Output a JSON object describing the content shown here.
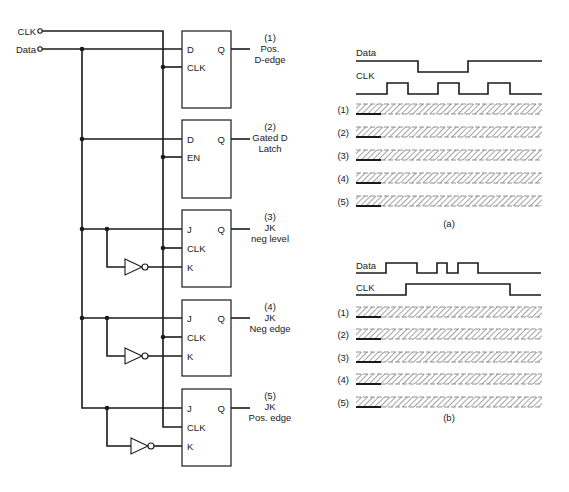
{
  "inputs": [
    {
      "label": "CLK",
      "y": 31
    },
    {
      "label": "Data",
      "y": 49
    }
  ],
  "colors": {
    "ink": "#1a1a1a",
    "hatch": "#555555",
    "background": "#ffffff"
  },
  "flipflops": [
    {
      "id": 1,
      "type": "D",
      "top": 31,
      "bottom": 108,
      "pins": [
        "D",
        "CLK"
      ],
      "pin_y": [
        49,
        67
      ],
      "q_label": "Q",
      "out_y": 49,
      "caption": [
        "(1)",
        "Pos.",
        "D-edge"
      ]
    },
    {
      "id": 2,
      "type": "D-latch",
      "top": 120,
      "bottom": 198,
      "pins": [
        "D",
        "EN"
      ],
      "pin_y": [
        139,
        157
      ],
      "q_label": "Q",
      "out_y": 139,
      "caption": [
        "(2)",
        "Gated D",
        "Latch"
      ]
    },
    {
      "id": 3,
      "type": "JK",
      "top": 210,
      "bottom": 287,
      "pins": [
        "J",
        "CLK",
        "K"
      ],
      "pin_y": [
        229,
        248,
        267
      ],
      "q_label": "Q",
      "out_y": 229,
      "caption": [
        "(3)",
        "JK",
        "neg level"
      ],
      "inverter_x": 125
    },
    {
      "id": 4,
      "type": "JK",
      "top": 300,
      "bottom": 376,
      "pins": [
        "J",
        "CLK",
        "K"
      ],
      "pin_y": [
        318,
        337,
        356
      ],
      "q_label": "Q",
      "out_y": 318,
      "caption": [
        "(4)",
        "JK",
        "Neg edge"
      ],
      "inverter_x": 125
    },
    {
      "id": 5,
      "type": "JK",
      "top": 389,
      "bottom": 466,
      "pins": [
        "J",
        "CLK",
        "K"
      ],
      "pin_y": [
        408,
        427,
        446
      ],
      "q_label": "Q",
      "out_y": 408,
      "caption": [
        "(5)",
        "JK",
        "Pos. edge"
      ],
      "inverter_x": 131
    }
  ],
  "timing": [
    {
      "id": "a",
      "caption": "(a)",
      "caption_y": 227,
      "signals": [
        {
          "label": "Data",
          "label_y": 56,
          "high_y": 61,
          "low_y": 72,
          "points": [
            [
              356,
              "H"
            ],
            [
              418,
              "H"
            ],
            [
              418,
              "L"
            ],
            [
              468,
              "L"
            ],
            [
              468,
              "H"
            ],
            [
              542,
              "H"
            ]
          ]
        },
        {
          "label": "CLK",
          "label_y": 79,
          "high_y": 83,
          "low_y": 94,
          "points": [
            [
              356,
              "L"
            ],
            [
              387,
              "L"
            ],
            [
              387,
              "H"
            ],
            [
              408,
              "H"
            ],
            [
              408,
              "L"
            ],
            [
              438,
              "L"
            ],
            [
              438,
              "H"
            ],
            [
              459,
              "H"
            ],
            [
              459,
              "L"
            ],
            [
              488,
              "L"
            ],
            [
              488,
              "H"
            ],
            [
              510,
              "H"
            ],
            [
              510,
              "L"
            ],
            [
              542,
              "L"
            ]
          ]
        }
      ],
      "outputs": [
        {
          "label": "(1)",
          "top": 104
        },
        {
          "label": "(2)",
          "top": 127
        },
        {
          "label": "(3)",
          "top": 150
        },
        {
          "label": "(4)",
          "top": 173
        },
        {
          "label": "(5)",
          "top": 196
        }
      ]
    },
    {
      "id": "b",
      "caption": "(b)",
      "caption_y": 421,
      "signals": [
        {
          "label": "Data",
          "label_y": 269,
          "high_y": 263,
          "low_y": 273,
          "points": [
            [
              356,
              "L"
            ],
            [
              386,
              "L"
            ],
            [
              386,
              "H"
            ],
            [
              417,
              "H"
            ],
            [
              417,
              "L"
            ],
            [
              437,
              "L"
            ],
            [
              437,
              "H"
            ],
            [
              447,
              "H"
            ],
            [
              447,
              "L"
            ],
            [
              458,
              "L"
            ],
            [
              458,
              "H"
            ],
            [
              478,
              "H"
            ],
            [
              478,
              "L"
            ],
            [
              541,
              "L"
            ]
          ]
        },
        {
          "label": "CLK",
          "label_y": 291,
          "high_y": 284,
          "low_y": 295,
          "points": [
            [
              356,
              "L"
            ],
            [
              406,
              "L"
            ],
            [
              406,
              "H"
            ],
            [
              510,
              "H"
            ],
            [
              510,
              "L"
            ],
            [
              541,
              "L"
            ]
          ]
        }
      ],
      "outputs": [
        {
          "label": "(1)",
          "top": 307
        },
        {
          "label": "(2)",
          "top": 329
        },
        {
          "label": "(3)",
          "top": 352
        },
        {
          "label": "(4)",
          "top": 374
        },
        {
          "label": "(5)",
          "top": 397
        }
      ]
    }
  ],
  "strip": {
    "x_start": 356,
    "x_end": 542,
    "height": 10,
    "known_until": 381
  }
}
